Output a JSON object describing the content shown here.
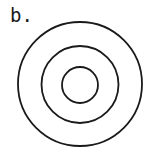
{
  "figure": {
    "label": "b.",
    "stroke_color": "#1a1a1a",
    "background": "#ffffff",
    "circles": [
      {
        "name": "outer",
        "cx": 80,
        "cy": 84,
        "r": 62
      },
      {
        "name": "middle",
        "cx": 80,
        "cy": 84.5,
        "r": 38.5
      },
      {
        "name": "inner",
        "cx": 80,
        "cy": 85,
        "r": 18
      }
    ]
  }
}
